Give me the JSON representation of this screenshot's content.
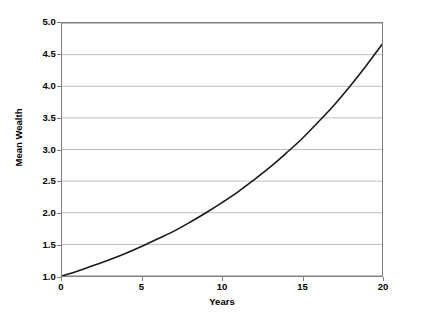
{
  "chart_data": {
    "type": "line",
    "title": "",
    "xlabel": "Years",
    "ylabel": "Mean Wealth",
    "xlim": [
      0,
      20
    ],
    "ylim": [
      1.0,
      5.0
    ],
    "grid": "horizontal",
    "legend": "none",
    "x_ticks": [
      "0",
      "5",
      "10",
      "15",
      "20"
    ],
    "x_tick_values": [
      0,
      5,
      10,
      15,
      20
    ],
    "y_ticks": [
      "1.0",
      "1.5",
      "2.0",
      "2.5",
      "3.0",
      "3.5",
      "4.0",
      "4.5",
      "5.0"
    ],
    "y_tick_values": [
      1.0,
      1.5,
      2.0,
      2.5,
      3.0,
      3.5,
      4.0,
      4.5,
      5.0
    ],
    "series": [
      {
        "name": "Mean Wealth",
        "color": "#1a1a1a",
        "x": [
          0,
          1,
          2,
          3,
          4,
          5,
          6,
          7,
          8,
          9,
          10,
          11,
          12,
          13,
          14,
          15,
          16,
          17,
          18,
          19,
          20
        ],
        "values": [
          1.0,
          1.08,
          1.17,
          1.26,
          1.36,
          1.47,
          1.59,
          1.71,
          1.85,
          2.0,
          2.16,
          2.33,
          2.52,
          2.72,
          2.94,
          3.17,
          3.43,
          3.7,
          4.0,
          4.32,
          4.66
        ]
      }
    ]
  },
  "axis": {
    "x_title": "Years",
    "y_title": "Mean Wealth"
  },
  "style": {
    "background": "#ffffff",
    "grid_color": "#bfbfbf",
    "border_color": "#808080",
    "line_color": "#1a1a1a",
    "text_color": "#000000"
  }
}
